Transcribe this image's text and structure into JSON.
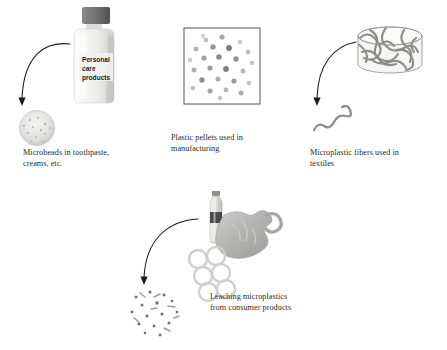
{
  "figure": {
    "background_color": "#ffffff",
    "text_color": "#2b2b2b",
    "arrow_color": "#1a1a1a",
    "outline_color": "#555555"
  },
  "panels": [
    {
      "id": "microbeads",
      "source_icon": "plastic-bottle-icon",
      "bottle_label_lines": [
        "Personal",
        "care",
        "products"
      ],
      "bottle_cap_color": "#6e6e6e",
      "bottle_body_color": "#e8e8e6",
      "result_icon": "microbead-dish-icon",
      "result_color": "#dcdcdc",
      "caption": "Microbeads in toothpaste,\ncreams, etc."
    },
    {
      "id": "pellets",
      "source_icon": "pellet-box-icon",
      "box_border_color": "#555555",
      "pellet_colors": [
        "#9b9b9b",
        "#b5b5b5",
        "#7d7d7d",
        "#c9c9c9",
        "#8a8a8a"
      ],
      "pellet_count": 26,
      "caption": "Plastic pellets used in\nmanufacturing"
    },
    {
      "id": "fibers",
      "source_icon": "textile-cylinder-icon",
      "cylinder_color": "#f2f2f0",
      "fiber_color": "#8e8e8e",
      "result_icon": "microfiber-squiggle-icon",
      "caption": "Microplastic fibers used in\ntextiles"
    },
    {
      "id": "leaching",
      "source_icons": [
        "water-bottle-icon",
        "plastic-bag-icon",
        "six-pack-ring-icon"
      ],
      "bottle_color": "#d8d8d6",
      "bottle_band_color": "#4a4a4a",
      "bag_color": "#b9b9b7",
      "ring_color": "#cfcfcd",
      "result_icon": "scattered-microplastics-icon",
      "particle_count": 22,
      "caption": "Leaching microplastics\nfrom consumer products"
    }
  ]
}
